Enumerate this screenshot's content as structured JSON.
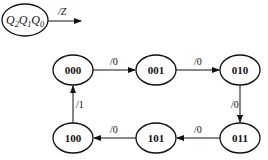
{
  "legend": {
    "state_text": "Q2Q1Q0",
    "state_parts": [
      "Q",
      "2",
      "Q",
      "1",
      "Q",
      "0"
    ],
    "output_label": "/Z"
  },
  "states": [
    {
      "id": "s000",
      "label": "000"
    },
    {
      "id": "s001",
      "label": "001"
    },
    {
      "id": "s010",
      "label": "010"
    },
    {
      "id": "s011",
      "label": "011"
    },
    {
      "id": "s101",
      "label": "101"
    },
    {
      "id": "s100",
      "label": "100"
    }
  ],
  "transitions": [
    {
      "from": "000",
      "to": "001",
      "label": "/0"
    },
    {
      "from": "001",
      "to": "010",
      "label": "/0"
    },
    {
      "from": "010",
      "to": "011",
      "label": "/0"
    },
    {
      "from": "011",
      "to": "101",
      "label": "/0"
    },
    {
      "from": "101",
      "to": "100",
      "label": "/0"
    },
    {
      "from": "100",
      "to": "000",
      "label": "/1"
    }
  ]
}
